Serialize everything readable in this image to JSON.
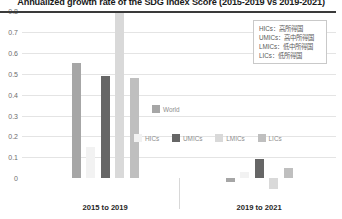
{
  "chart_data": {
    "type": "bar",
    "title": "Annualized growth rate of the SDG Index Score (2015-2019 vs 2019-2021)",
    "xlabel": "",
    "ylabel": "",
    "categories": [
      "2015 to 2019",
      "2019 to 2021"
    ],
    "ylim": [
      -0.08,
      0.8
    ],
    "yticks": [
      "0",
      "0.1",
      "0.2",
      "0.3",
      "0.4",
      "0.5",
      "0.6",
      "0.7",
      "0.8"
    ],
    "ytick_values": [
      0,
      0.1,
      0.2,
      0.3,
      0.4,
      0.5,
      0.6,
      0.7,
      0.8
    ],
    "grid": true,
    "legend_position": "inside-right",
    "series": [
      {
        "name": "World",
        "color": "#a6a6a6",
        "values": [
          0.55,
          -0.02
        ]
      },
      {
        "name": "HICs",
        "color": "#f2f2f2",
        "values": [
          0.15,
          0.03
        ]
      },
      {
        "name": "UMICs",
        "color": "#666666",
        "values": [
          0.49,
          0.09
        ]
      },
      {
        "name": "LMICs",
        "color": "#d9d9d9",
        "values": [
          0.79,
          -0.05
        ]
      },
      {
        "name": "LICs",
        "color": "#bfbfbf",
        "values": [
          0.48,
          0.05
        ]
      }
    ]
  },
  "legend_inline": {
    "row1": [
      {
        "label": "World"
      }
    ],
    "row2": [
      {
        "label": "HICs"
      },
      {
        "label": "UMICs"
      },
      {
        "label": "LMICs"
      },
      {
        "label": "LICs"
      }
    ]
  },
  "legend_box": {
    "lines": [
      "HICs：高所得国",
      "UMICs：高中所得国",
      "LMICs：低中所得国",
      "LICs：低所得国"
    ]
  }
}
